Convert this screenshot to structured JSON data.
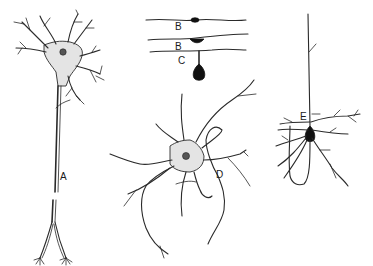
{
  "figure": {
    "colors": {
      "background": "#ffffff",
      "ink": "#2a2a2a",
      "soma_fill": "#e4e4e4",
      "dark_soma": "#111111"
    },
    "labels": {
      "A": "A",
      "B1": "B",
      "B2": "B",
      "C": "C",
      "D": "D",
      "E": "E"
    },
    "neurons": [
      {
        "id": "A",
        "type": "multipolar neuron with long axon (broken)"
      },
      {
        "id": "B1",
        "type": "bipolar neuron"
      },
      {
        "id": "B2",
        "type": "bipolar neuron"
      },
      {
        "id": "C",
        "type": "unipolar neuron"
      },
      {
        "id": "D",
        "type": "multipolar neuron"
      },
      {
        "id": "E",
        "type": "pyramidal neuron"
      }
    ]
  }
}
